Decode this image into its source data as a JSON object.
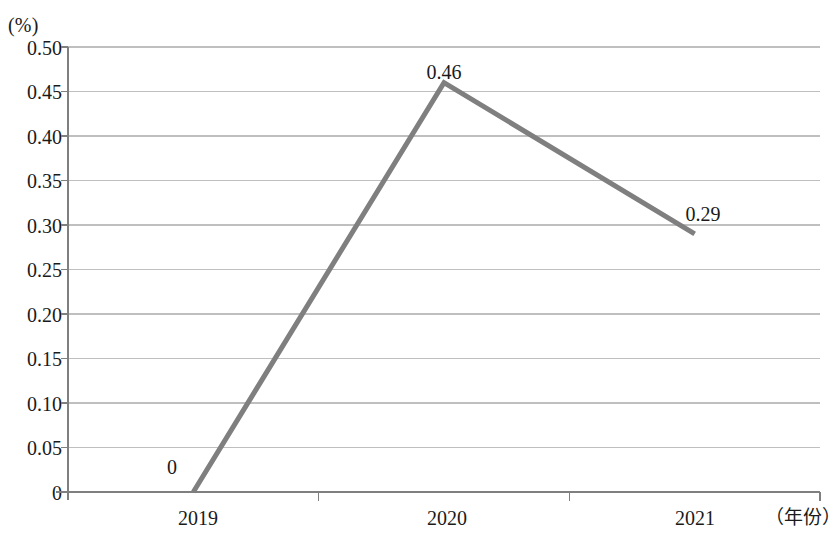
{
  "chart_data": {
    "type": "line",
    "title": "",
    "subtitle": "",
    "xlabel": "（年份）",
    "ylabel": "(%)",
    "unit_label": "(%)",
    "categories": [
      "2019",
      "2020",
      "2021"
    ],
    "values": [
      0,
      0.46,
      0.29
    ],
    "point_labels": [
      "0",
      "0.46",
      "0.29"
    ],
    "series": [
      {
        "name": "",
        "values": [
          0,
          0.46,
          0.29
        ]
      }
    ],
    "ylim": [
      0,
      0.5
    ],
    "ytick_values": [
      0.5,
      0.45,
      0.4,
      0.35,
      0.3,
      0.25,
      0.2,
      0.15,
      0.1,
      0.05,
      0
    ],
    "ytick_labels": [
      "0.50",
      "0.45",
      "0.40",
      "0.35",
      "0.30",
      "0.25",
      "0.20",
      "0.15",
      "0.10",
      "0.05",
      "0"
    ],
    "grid": true,
    "grid_axis": "y",
    "legend": false,
    "legend_position": "none",
    "colors": {
      "line": "#7f7f7f",
      "grid": "#bfbfbf",
      "axis": "#7f7f7f",
      "text": "#1a1a1a",
      "background": "#ffffff"
    },
    "line_width": 5
  },
  "axis": {
    "y_labels": [
      {
        "text": "0.50",
        "top": 38
      },
      {
        "text": "0.45",
        "top": 82
      },
      {
        "text": "0.40",
        "top": 127
      },
      {
        "text": "0.35",
        "top": 171
      },
      {
        "text": "0.30",
        "top": 216
      },
      {
        "text": "0.25",
        "top": 260
      },
      {
        "text": "0.20",
        "top": 305
      },
      {
        "text": "0.15",
        "top": 349
      },
      {
        "text": "0.10",
        "top": 394
      },
      {
        "text": "0.05",
        "top": 438
      },
      {
        "text": "0",
        "top": 483
      }
    ],
    "x_labels": [
      {
        "text": "2019",
        "left": 198
      },
      {
        "text": "2020",
        "left": 447
      },
      {
        "text": "2021",
        "left": 695
      }
    ]
  },
  "data_labels": [
    {
      "text": "0",
      "left": 172,
      "top": 457
    },
    {
      "text": "0.46",
      "left": 444,
      "top": 62
    },
    {
      "text": "0.29",
      "left": 703,
      "top": 204
    }
  ]
}
